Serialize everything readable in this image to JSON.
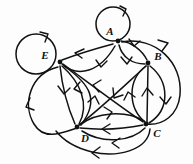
{
  "figure": {
    "background_color": "#fdfdfd",
    "stroke_color": "#111111"
  },
  "nodes": [
    {
      "id": "A",
      "label": "A",
      "x": 118,
      "y": 41,
      "label_x": 110,
      "label_y": 34
    },
    {
      "id": "B",
      "label": "B",
      "x": 148,
      "y": 63,
      "label_x": 157,
      "label_y": 58
    },
    {
      "id": "C",
      "label": "C",
      "x": 146,
      "y": 124,
      "label_x": 155,
      "label_y": 133
    },
    {
      "id": "D",
      "label": "D",
      "x": 77,
      "y": 127,
      "label_x": 85,
      "label_y": 137
    },
    {
      "id": "E",
      "label": "E",
      "x": 60,
      "y": 62,
      "label_x": 46,
      "label_y": 57
    }
  ],
  "self_loops": [
    {
      "at": "A",
      "cx": 113,
      "cy": 24,
      "r": 17,
      "arrow_at_deg": 40
    },
    {
      "at": "E",
      "cx": 35,
      "cy": 53,
      "r": 20,
      "arrow_at_deg": 50
    }
  ],
  "edges": [
    {
      "from": "E",
      "to": "A",
      "curve": "straight-ish",
      "direction": "A->E"
    },
    {
      "from": "E",
      "to": "A",
      "curve": "bulge-down",
      "direction": "E->A"
    },
    {
      "from": "A",
      "to": "B",
      "curve": "bulge-left",
      "direction": "A->B"
    },
    {
      "from": "A",
      "to": "B",
      "curve": "bulge-right",
      "direction": "A->B"
    },
    {
      "from": "A",
      "to": "C",
      "curve": "outer-right-arc",
      "direction": "C->A"
    },
    {
      "from": "E",
      "to": "D",
      "curve": "straight",
      "direction": "E->D"
    },
    {
      "from": "E",
      "to": "D",
      "curve": "bulge-right",
      "direction": "D->E"
    },
    {
      "from": "E",
      "to": "D",
      "curve": "outer-left-arc",
      "direction": "D->E"
    },
    {
      "from": "E",
      "to": "C",
      "curve": "long-diagonal",
      "direction": "C->E"
    },
    {
      "from": "B",
      "to": "D",
      "curve": "long-diagonal",
      "direction": "B->D"
    },
    {
      "from": "B",
      "to": "C",
      "curve": "straight",
      "direction": "C->B"
    },
    {
      "from": "B",
      "to": "C",
      "curve": "bulge-left",
      "direction": "C->B"
    },
    {
      "from": "B",
      "to": "C",
      "curve": "bulge-right",
      "direction": "B->C"
    },
    {
      "from": "D",
      "to": "C",
      "curve": "bulge-up",
      "direction": "D->C"
    },
    {
      "from": "D",
      "to": "C",
      "curve": "straight",
      "direction": "C->D"
    },
    {
      "from": "D",
      "to": "C",
      "curve": "bulge-down",
      "direction": "C->D"
    },
    {
      "from": "D",
      "to": "C",
      "curve": "outer-bottom-arc",
      "direction": "C->D"
    }
  ],
  "counts": {
    "node_count": 5,
    "edge_count": 17,
    "self_loop_count": 2
  }
}
